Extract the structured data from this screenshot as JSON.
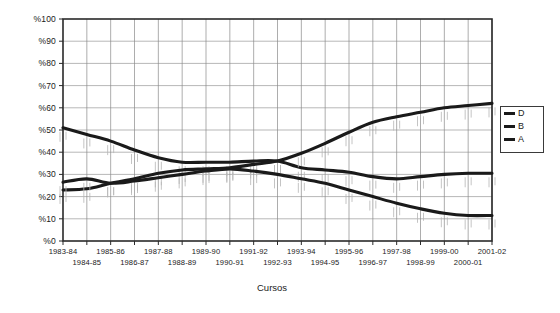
{
  "chart_data": {
    "type": "line",
    "title": "",
    "xlabel": "Cursos",
    "ylabel": "",
    "ylim": [
      0,
      100
    ],
    "grid": true,
    "legend_position": "right",
    "y_ticks": [
      "%0",
      "%10",
      "%20",
      "%30",
      "%40",
      "%50",
      "%60",
      "%70",
      "%80",
      "%90",
      "%100"
    ],
    "y_tick_values": [
      0,
      10,
      20,
      30,
      40,
      50,
      60,
      70,
      80,
      90,
      100
    ],
    "categories": [
      "1983-84",
      "1984-85",
      "1985-86",
      "1986-87",
      "1987-88",
      "1988-89",
      "1989-90",
      "1990-91",
      "1991-92",
      "1992-93",
      "1993-94",
      "1994-95",
      "1995-96",
      "1996-97",
      "1997-98",
      "1998-99",
      "1999-00",
      "2000-01",
      "2001-02"
    ],
    "series": [
      {
        "name": "D",
        "color": "#1a1a1a",
        "values": [
          51,
          48,
          45,
          41,
          37.5,
          35.5,
          35.5,
          35.5,
          36,
          36,
          33,
          32,
          31,
          29,
          28,
          29,
          30,
          30.5,
          30.5
        ]
      },
      {
        "name": "B",
        "color": "#1a1a1a",
        "values": [
          23,
          23.5,
          26,
          28,
          30.5,
          32,
          32.5,
          33,
          34.5,
          36,
          39.5,
          44,
          49,
          53.5,
          56,
          58,
          60,
          61,
          62
        ]
      },
      {
        "name": "A",
        "color": "#1a1a1a",
        "values": [
          26.5,
          28,
          26,
          27,
          28.5,
          30,
          31.5,
          32.5,
          31.5,
          30,
          28,
          26,
          23,
          20,
          17,
          14.5,
          12.5,
          11.5,
          11.5
        ]
      }
    ]
  },
  "legend": {
    "entries": [
      {
        "label": "D"
      },
      {
        "label": "B"
      },
      {
        "label": "A"
      }
    ]
  },
  "axis": {
    "x_title": "Cursos"
  }
}
